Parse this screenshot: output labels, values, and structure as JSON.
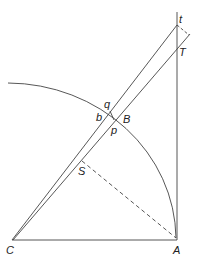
{
  "diagram": {
    "labels": {
      "t": "t",
      "T": "T",
      "q": "q",
      "b": "b",
      "B": "B",
      "p": "p",
      "S": "S",
      "C": "C",
      "A": "A"
    },
    "colors": {
      "stroke": "#444444",
      "background": "#ffffff"
    }
  }
}
